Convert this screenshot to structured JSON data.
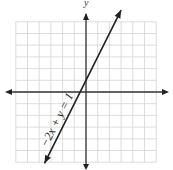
{
  "chart_data": {
    "type": "line",
    "title": "",
    "xlabel": "",
    "ylabel": "y",
    "xlim": [
      -6,
      6
    ],
    "ylim": [
      -6,
      6
    ],
    "grid": true,
    "grid_step": 1,
    "series": [
      {
        "name": "-2x + y = 1",
        "equation": "y = 2x + 1",
        "slope": 2,
        "intercept": 1,
        "x": [
          -3.5,
          0,
          3.75
        ],
        "y": [
          -6,
          1,
          8.5
        ]
      }
    ],
    "annotations": [
      {
        "text": "−2x + y = 1",
        "rotation": -63,
        "position": "along line, lower left"
      }
    ]
  },
  "labels": {
    "y_axis": "y",
    "line_label": "−2x + y = 1"
  },
  "colors": {
    "grid": "#d4d4d4",
    "axis": "#333333",
    "line": "#222222"
  }
}
